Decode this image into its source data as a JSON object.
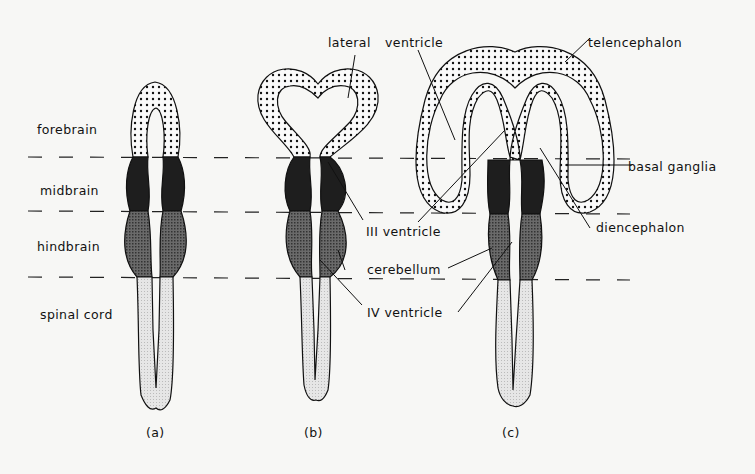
{
  "diagram": {
    "region_labels": {
      "forebrain": "forebrain",
      "midbrain": "midbrain",
      "hindbrain": "hindbrain",
      "spinal_cord": "spinal cord"
    },
    "stage_labels": {
      "a": "(a)",
      "b": "(b)",
      "c": "(c)"
    },
    "structure_labels": {
      "lateral_ventricle_b": "lateral",
      "ventricle_word": "ventricle",
      "telencephalon": "telencephalon",
      "basal_ganglia": "basal ganglia",
      "diencephalon": "diencephalon",
      "third_ventricle": "III ventricle",
      "cerebellum": "cerebellum",
      "fourth_ventricle": "IV ventricle"
    },
    "colors": {
      "background": "#f7f7f5",
      "ink": "#111111",
      "forebrain_fill": "dotted",
      "midbrain_fill": "#1e1e1e",
      "hindbrain_fill": "#5a5a5a",
      "spinal_fill": "#e2e2e2"
    }
  }
}
